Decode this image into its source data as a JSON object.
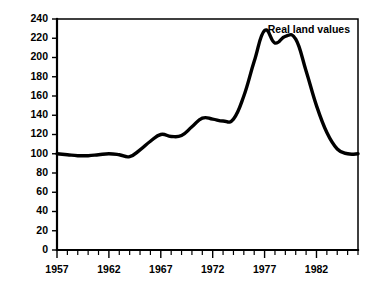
{
  "chart_data": {
    "type": "line",
    "title": "",
    "subtitle": "",
    "xlabel": "",
    "ylabel": "",
    "xlim": [
      1957,
      1986
    ],
    "ylim": [
      0,
      240
    ],
    "ytick_step": 20,
    "xtick_step_minor": 1,
    "xtick_step_major": 5,
    "grid": false,
    "legend_position": "top-right",
    "legend_entries": [
      "Real land values"
    ],
    "yticks": [
      0,
      20,
      40,
      60,
      80,
      100,
      120,
      140,
      160,
      180,
      200,
      220,
      240
    ],
    "ytick_labels": [
      "0",
      "20",
      "40",
      "60",
      "80",
      "100",
      "120",
      "140",
      "160",
      "180",
      "200",
      "220",
      "240"
    ],
    "xticks": [
      1957,
      1962,
      1967,
      1972,
      1977,
      1982
    ],
    "xtick_labels": [
      "1957",
      "1962",
      "1967",
      "1972",
      "1977",
      "1982"
    ],
    "xticks_minor": [
      1957,
      1958,
      1959,
      1960,
      1961,
      1962,
      1963,
      1964,
      1965,
      1966,
      1967,
      1968,
      1969,
      1970,
      1971,
      1972,
      1973,
      1974,
      1975,
      1976,
      1977,
      1978,
      1979,
      1980,
      1981,
      1982,
      1983,
      1984,
      1985,
      1986
    ],
    "series": [
      {
        "name": "Real land values",
        "x": [
          1957,
          1958,
          1959,
          1960,
          1961,
          1962,
          1963,
          1964,
          1965,
          1966,
          1967,
          1968,
          1969,
          1970,
          1971,
          1972,
          1973,
          1974,
          1975,
          1976,
          1977,
          1978,
          1979,
          1980,
          1981,
          1982,
          1983,
          1984,
          1985,
          1986
        ],
        "values": [
          100,
          99,
          98,
          98,
          99,
          100,
          99,
          97,
          104,
          113,
          120,
          118,
          119,
          128,
          137,
          136,
          134,
          136,
          160,
          196,
          228,
          215,
          222,
          219,
          186,
          150,
          122,
          105,
          100,
          100
        ]
      }
    ]
  },
  "legend": {
    "label": "Real land values"
  }
}
